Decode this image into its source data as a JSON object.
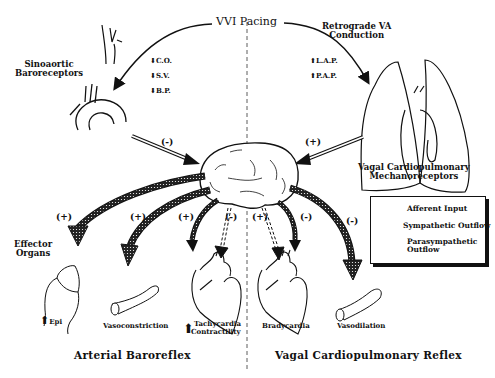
{
  "title": "VVI Pacing",
  "top_right_label": [
    "Retrograde VA",
    "Conduction"
  ],
  "left_receptor_label": [
    "Sinoaortic",
    "Baroreceptors"
  ],
  "right_receptor_label": [
    "Vagal Cardiopulmonary",
    "Mechanoreceptors"
  ],
  "left_changes": [
    {
      "direction": "down",
      "label": "C.O."
    },
    {
      "direction": "down",
      "label": "S.V."
    },
    {
      "direction": "down",
      "label": "B.P."
    }
  ],
  "right_changes": [
    {
      "direction": "up",
      "label": "L.A.P."
    },
    {
      "direction": "up",
      "label": "P.A.P."
    }
  ],
  "afferent_signs": {
    "left": "(-)",
    "right": "(+)"
  },
  "effector_label": [
    "Effector",
    "Organs"
  ],
  "effector_signs": [
    "(+)",
    "(+)",
    "(+)",
    "(-)",
    "(+)",
    "(-)",
    "(-)"
  ],
  "effectors": {
    "adrenal": {
      "direction": "up",
      "label": "Epi"
    },
    "vasoconstriction": "Vasoconstriction",
    "tachycardia": {
      "direction": "up",
      "lines": [
        "Tachycardia",
        "Contractility"
      ]
    },
    "bradycardia": "Bradycardia",
    "vasodilation": "Vasodilation"
  },
  "legend": {
    "items": [
      {
        "type": "afferent",
        "label": "Afferent Input"
      },
      {
        "type": "sympathetic",
        "label": "Sympathetic Outflow"
      },
      {
        "type": "parasympathetic",
        "lines": [
          "Parasympathetic",
          "Outflow"
        ]
      }
    ]
  },
  "sections": {
    "left": "Arterial Baroreflex",
    "right": "Vagal Cardiopulmonary Reflex"
  }
}
